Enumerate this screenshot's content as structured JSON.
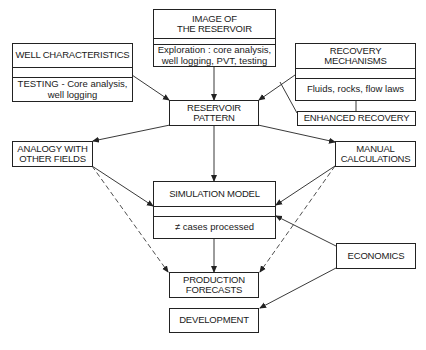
{
  "diagram": {
    "nodes": {
      "image_of_reservoir": {
        "title": "IMAGE OF\nTHE RESERVOIR",
        "title_l1": "IMAGE OF",
        "title_l2": "THE RESERVOIR",
        "detail_l1": "Exploration : core analysis,",
        "detail_l2": "well logging, PVT, testing"
      },
      "well_characteristics": {
        "title": "WELL CHARACTERISTICS",
        "detail_l1": "TESTING - Core analysis,",
        "detail_l2": "well logging"
      },
      "recovery_mechanisms": {
        "title": "RECOVERY MECHANISMS",
        "detail": "Fluids, rocks, flow laws"
      },
      "enhanced_recovery": {
        "title": "ENHANCED RECOVERY"
      },
      "reservoir_pattern": {
        "title_l1": "RESERVOIR",
        "title_l2": "PATTERN"
      },
      "analogy": {
        "title_l1": "ANALOGY WITH",
        "title_l2": "OTHER FIELDS"
      },
      "manual_calculations": {
        "title_l1": "MANUAL",
        "title_l2": "CALCULATIONS"
      },
      "simulation_model": {
        "title": "SIMULATION MODEL",
        "detail": "≠ cases processed"
      },
      "economics": {
        "title": "ECONOMICS"
      },
      "production_forecasts": {
        "title_l1": "PRODUCTION",
        "title_l2": "FORECASTS"
      },
      "development": {
        "title": "DEVELOPMENT"
      }
    },
    "edges": [
      {
        "from": "image_of_reservoir",
        "to": "reservoir_pattern",
        "style": "solid"
      },
      {
        "from": "well_characteristics",
        "to": "reservoir_pattern",
        "style": "solid"
      },
      {
        "from": "recovery_mechanisms",
        "to": "reservoir_pattern",
        "style": "solid"
      },
      {
        "from": "recovery_mechanisms",
        "to": "enhanced_recovery",
        "style": "line"
      },
      {
        "from": "reservoir_pattern",
        "to": "analogy",
        "style": "solid"
      },
      {
        "from": "reservoir_pattern",
        "to": "simulation_model",
        "style": "solid"
      },
      {
        "from": "reservoir_pattern",
        "to": "manual_calculations",
        "style": "solid"
      },
      {
        "from": "analogy",
        "to": "simulation_model",
        "style": "solid"
      },
      {
        "from": "analogy",
        "to": "production_forecasts",
        "style": "dashed"
      },
      {
        "from": "manual_calculations",
        "to": "simulation_model",
        "style": "solid"
      },
      {
        "from": "manual_calculations",
        "to": "production_forecasts",
        "style": "dashed"
      },
      {
        "from": "economics",
        "to": "simulation_model",
        "style": "solid"
      },
      {
        "from": "simulation_model",
        "to": "production_forecasts",
        "style": "solid"
      },
      {
        "from": "economics",
        "to": "development",
        "style": "solid"
      }
    ],
    "colors": {
      "line": "#222222",
      "background": "#ffffff"
    }
  }
}
